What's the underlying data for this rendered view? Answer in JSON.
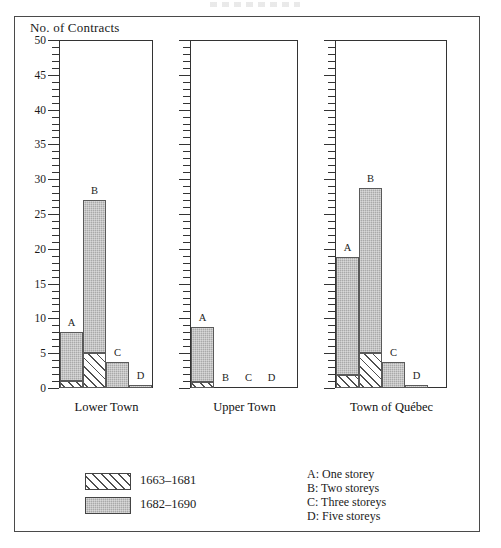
{
  "figure": {
    "y_axis_title": "No. of Contracts",
    "group_labels": [
      "Lower Town",
      "Upper Town",
      "Town of Québec"
    ],
    "bar_letters": [
      "A",
      "B",
      "C",
      "D"
    ]
  },
  "legend": {
    "series": [
      {
        "label": "1663–1681",
        "swatch": "hatched"
      },
      {
        "label": "1682–1690",
        "swatch": "solid-gray"
      }
    ]
  },
  "key": {
    "entries": [
      "A: One storey",
      "B: Two storeys",
      "C: Three storeys",
      "D: Five storeys"
    ]
  },
  "axis": {
    "ticks_major": [
      0,
      5,
      10,
      15,
      20,
      25,
      30,
      35,
      40,
      45,
      50
    ],
    "tick_labels": [
      "0",
      "5",
      "10",
      "15",
      "20",
      "25",
      "30",
      "35",
      "40",
      "45",
      "50"
    ],
    "minor_step": 1,
    "ymin": 0,
    "ymax": 50
  },
  "colors": {
    "bar_fill": "#a9a9a9",
    "bar_border": "#5a5a5a",
    "hatch_line": "#4f4f4f",
    "axis": "#333333",
    "frame": "#4a4a4a",
    "text": "#1a1a1a"
  },
  "chart_data": {
    "type": "bar",
    "title": "",
    "subtitle": "",
    "xlabel": "",
    "ylabel": "No. of Contracts",
    "ylim": [
      0,
      50
    ],
    "grid": false,
    "legend_position": "bottom-left",
    "stacked": true,
    "panels": [
      {
        "name": "Lower Town",
        "categories": [
          "A",
          "B",
          "C",
          "D"
        ],
        "category_labels": [
          "A: One storey",
          "B: Two storeys",
          "C: Three storeys",
          "D: Five storeys"
        ],
        "series": [
          {
            "name": "1663–1681",
            "values": [
              1.0,
              5.0,
              0.0,
              0.0
            ]
          },
          {
            "name": "1682–1690",
            "values": [
              7.0,
              22.0,
              3.7,
              0.5
            ]
          }
        ],
        "totals": [
          8.0,
          27.0,
          3.7,
          0.5
        ]
      },
      {
        "name": "Upper Town",
        "categories": [
          "A",
          "B",
          "C",
          "D"
        ],
        "category_labels": [
          "A: One storey",
          "B: Two storeys",
          "C: Three storeys",
          "D: Five storeys"
        ],
        "series": [
          {
            "name": "1663–1681",
            "values": [
              0.8,
              0.0,
              0.0,
              0.0
            ]
          },
          {
            "name": "1682–1690",
            "values": [
              7.9,
              0.0,
              0.0,
              0.0
            ]
          }
        ],
        "totals": [
          8.7,
          0.0,
          0.0,
          0.0
        ]
      },
      {
        "name": "Town of Québec",
        "categories": [
          "A",
          "B",
          "C",
          "D"
        ],
        "category_labels": [
          "A: One storey",
          "B: Two storeys",
          "C: Three storeys",
          "D: Five storeys"
        ],
        "series": [
          {
            "name": "1663–1681",
            "values": [
              1.8,
              5.0,
              0.0,
              0.0
            ]
          },
          {
            "name": "1682–1690",
            "values": [
              17.0,
              23.8,
              3.7,
              0.5
            ]
          }
        ],
        "totals": [
          18.8,
          28.8,
          3.7,
          0.5
        ]
      }
    ]
  }
}
